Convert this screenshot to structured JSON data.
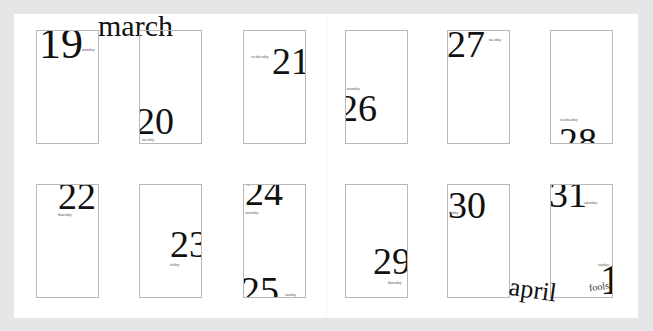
{
  "months": {
    "march": "march",
    "april": "april"
  },
  "days": [
    {
      "num": "19",
      "weekday": "monday"
    },
    {
      "num": "20",
      "weekday": "tuesday"
    },
    {
      "num": "21",
      "weekday": "wednesday"
    },
    {
      "num": "22",
      "weekday": "thursday"
    },
    {
      "num": "23",
      "weekday": "friday"
    },
    {
      "num": "24",
      "weekday": "saturday"
    },
    {
      "num": "25",
      "weekday": "sunday"
    },
    {
      "num": "26",
      "weekday": "monday"
    },
    {
      "num": "27",
      "weekday": "tuesday"
    },
    {
      "num": "28",
      "weekday": "wednesday"
    },
    {
      "num": "29",
      "weekday": "thursday"
    },
    {
      "num": "30",
      "weekday": "friday"
    },
    {
      "num": "31",
      "weekday": "saturday"
    },
    {
      "num": "1",
      "weekday": "sunday",
      "note": "fools"
    }
  ],
  "colors": {
    "background": "#e6e6e6",
    "page": "#ffffff",
    "box_border": "#b8b8b8",
    "text": "#111111"
  }
}
